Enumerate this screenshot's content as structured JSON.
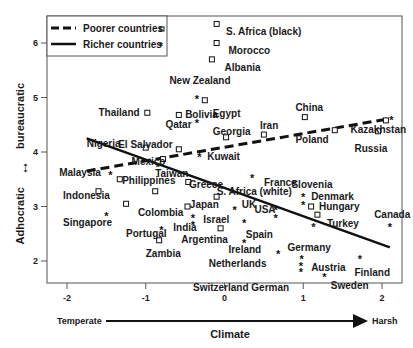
{
  "chart_data": {
    "type": "scatter",
    "title": "",
    "xlabel": "Climate",
    "xlabel_left": "Temperate",
    "xlabel_right": "Harsh",
    "ylabel": "Adhocratic ↔ bureaucratic",
    "ylabel_left": "Adhocratic",
    "ylabel_right": "bureaucratic",
    "xlim": [
      -2.25,
      2.25
    ],
    "ylim": [
      1.5,
      6.5
    ],
    "xticks": [
      -2,
      -1,
      0,
      1,
      2
    ],
    "yticks": [
      2,
      3,
      4,
      5,
      6
    ],
    "grid": false,
    "legend_position": "top-left",
    "legend": [
      {
        "label": "Poorer countries",
        "line": "dashed",
        "marker": "square"
      },
      {
        "label": "Richer countries",
        "line": "solid",
        "marker": "star"
      }
    ],
    "trendlines": [
      {
        "name": "Poorer countries",
        "style": "dashed",
        "x": [
          -1.75,
          2.05
        ],
        "y": [
          3.65,
          4.6
        ]
      },
      {
        "name": "Richer countries",
        "style": "solid",
        "x": [
          -1.75,
          2.1
        ],
        "y": [
          4.25,
          2.25
        ]
      }
    ],
    "series": [
      {
        "name": "Poorer countries",
        "marker": "square",
        "points": [
          {
            "label": "S. Africa (black)",
            "x": -0.1,
            "y": 6.35,
            "lx": 0.02,
            "ly": 6.2
          },
          {
            "label": "Morocco",
            "x": -0.1,
            "y": 6.0,
            "lx": 0.05,
            "ly": 5.85
          },
          {
            "label": "Albania",
            "x": -0.16,
            "y": 5.7,
            "lx": 0.0,
            "ly": 5.55
          },
          {
            "label": "Egypt",
            "x": -0.25,
            "y": 4.95,
            "lx": -0.15,
            "ly": 4.7
          },
          {
            "label": "Bolivia",
            "x": -0.58,
            "y": 4.68,
            "lx": -0.5,
            "ly": 4.68
          },
          {
            "label": "Thailand",
            "x": -0.98,
            "y": 4.72,
            "lx": -1.6,
            "ly": 4.72
          },
          {
            "label": "Georgia",
            "x": 0.02,
            "y": 4.27,
            "lx": -0.15,
            "ly": 4.37
          },
          {
            "label": "Iran",
            "x": 0.5,
            "y": 4.32,
            "lx": 0.45,
            "ly": 4.48
          },
          {
            "label": "China",
            "x": 1.02,
            "y": 4.64,
            "lx": 0.9,
            "ly": 4.8
          },
          {
            "label": "Poland",
            "x": 1.4,
            "y": 4.4,
            "lx": 0.9,
            "ly": 4.22
          },
          {
            "label": "Kazakhstan",
            "x": 2.05,
            "y": 4.58,
            "lx": 1.6,
            "ly": 4.4
          },
          {
            "label": "Russia",
            "x": 1.95,
            "y": 4.38,
            "lx": 1.65,
            "ly": 4.06
          },
          {
            "label": "Nigeria",
            "x": -1.0,
            "y": 4.08,
            "lx": -1.75,
            "ly": 4.15
          },
          {
            "label": "El Salvador",
            "x": -0.58,
            "y": 4.05,
            "lx": -1.35,
            "ly": 4.12
          },
          {
            "label": "Mexico",
            "x": -0.78,
            "y": 3.87,
            "lx": -1.18,
            "ly": 3.82
          },
          {
            "label": "Greece",
            "x": -0.46,
            "y": 3.45,
            "lx": -0.45,
            "ly": 3.4
          },
          {
            "label": "Indonesia",
            "x": -1.6,
            "y": 3.28,
            "lx": -2.05,
            "ly": 3.2
          },
          {
            "label": "Philippines",
            "x": -1.33,
            "y": 3.5,
            "lx": -1.3,
            "ly": 3.47
          },
          {
            "label": "Colombia",
            "x": -1.25,
            "y": 3.05,
            "lx": -1.1,
            "ly": 2.88
          },
          {
            "label": "Japan",
            "x": -0.47,
            "y": 3.0,
            "lx": -0.44,
            "ly": 3.03
          },
          {
            "label": "S. Africa (white)",
            "x": -0.1,
            "y": 3.18,
            "lx": -0.1,
            "ly": 3.26
          },
          {
            "label": "Hungary",
            "x": 1.1,
            "y": 3.0,
            "lx": 1.2,
            "ly": 3.0
          },
          {
            "label": "Turkey",
            "x": 1.18,
            "y": 2.85,
            "lx": 1.3,
            "ly": 2.68
          },
          {
            "label": "Argentina",
            "x": -0.05,
            "y": 2.6,
            "lx": -0.55,
            "ly": 2.38
          },
          {
            "label": "Zambia",
            "x": -0.83,
            "y": 2.38,
            "lx": -1.0,
            "ly": 2.12
          },
          {
            "label": "Pakistan-like (unlabeled)",
            "x": -0.88,
            "y": 3.28,
            "lx": null,
            "ly": null
          }
        ]
      },
      {
        "name": "Richer countries",
        "marker": "star",
        "points": [
          {
            "label": "New Zealand",
            "x": -0.35,
            "y": 5.0,
            "lx": -0.7,
            "ly": 5.3
          },
          {
            "label": "Qatar",
            "x": -0.35,
            "y": 4.55,
            "lx": -0.75,
            "ly": 4.5
          },
          {
            "label": "Kuwait",
            "x": -0.32,
            "y": 3.92,
            "lx": -0.22,
            "ly": 3.9
          },
          {
            "label": "Taiwan",
            "x": -0.85,
            "y": 3.75,
            "lx": -0.88,
            "ly": 3.6
          },
          {
            "label": "Malaysia",
            "x": -1.45,
            "y": 3.6,
            "lx": -2.1,
            "ly": 3.62
          },
          {
            "label": "Singapore",
            "x": -1.5,
            "y": 2.85,
            "lx": -2.05,
            "ly": 2.7
          },
          {
            "label": "France",
            "x": 0.35,
            "y": 3.55,
            "lx": 0.5,
            "ly": 3.44
          },
          {
            "label": "Slovenia",
            "x": 1.0,
            "y": 3.2,
            "lx": 0.85,
            "ly": 3.4
          },
          {
            "label": "Denmark",
            "x": 1.0,
            "y": 3.05,
            "lx": 1.1,
            "ly": 3.18
          },
          {
            "label": "UK",
            "x": 0.13,
            "y": 2.95,
            "lx": 0.22,
            "ly": 3.03
          },
          {
            "label": "USA",
            "x": 0.65,
            "y": 2.95,
            "lx": 0.38,
            "ly": 2.93
          },
          {
            "label": "USA-2",
            "x": 0.65,
            "y": 2.8,
            "lx": null,
            "ly": null
          },
          {
            "label": "Turkey-star",
            "x": 1.13,
            "y": 2.65,
            "lx": null,
            "ly": null
          },
          {
            "label": "Israel",
            "x": -0.4,
            "y": 2.8,
            "lx": -0.27,
            "ly": 2.75
          },
          {
            "label": "India",
            "x": -0.4,
            "y": 2.68,
            "lx": -0.65,
            "ly": 2.6
          },
          {
            "label": "Portugal",
            "x": -0.8,
            "y": 2.58,
            "lx": -1.25,
            "ly": 2.5
          },
          {
            "label": "Spain",
            "x": 0.25,
            "y": 2.72,
            "lx": 0.27,
            "ly": 2.48
          },
          {
            "label": "Ireland",
            "x": 0.25,
            "y": 2.35,
            "lx": 0.05,
            "ly": 2.2
          },
          {
            "label": "Netherlands",
            "x": 0.68,
            "y": 2.15,
            "lx": -0.2,
            "ly": 1.95
          },
          {
            "label": "Germany",
            "x": 0.98,
            "y": 2.05,
            "lx": 0.8,
            "ly": 2.23
          },
          {
            "label": "Austria",
            "x": 0.97,
            "y": 1.92,
            "lx": 1.1,
            "ly": 1.88
          },
          {
            "label": "Switzerland German",
            "x": 0.97,
            "y": 1.82,
            "lx": -0.4,
            "ly": 1.5
          },
          {
            "label": "Sweden",
            "x": 1.27,
            "y": 1.73,
            "lx": 1.35,
            "ly": 1.55
          },
          {
            "label": "Finland",
            "x": 1.72,
            "y": 2.05,
            "lx": 1.65,
            "ly": 1.78
          },
          {
            "label": "Canada",
            "x": 2.1,
            "y": 2.65,
            "lx": 1.9,
            "ly": 2.85
          },
          {
            "label": "Kazakhstan-star",
            "x": 2.12,
            "y": 4.6,
            "lx": null,
            "ly": null
          }
        ]
      }
    ]
  },
  "axes": {
    "x_title": "Climate",
    "x_left": "Temperate",
    "x_right": "Harsh",
    "y_left": "Adhocratic",
    "y_right": "bureaucratic",
    "x_ticks": [
      "-2",
      "-1",
      "0",
      "1",
      "2"
    ],
    "y_ticks": [
      "2",
      "3",
      "4",
      "5",
      "6"
    ]
  },
  "legend": {
    "poorer": "Poorer countries",
    "richer": "Richer countries"
  }
}
